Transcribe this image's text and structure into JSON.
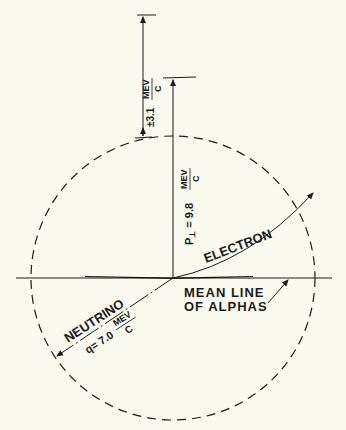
{
  "diagram": {
    "background": "#fbfaee",
    "ink": "#1a1a1a",
    "labels": {
      "electron": "ELECTRON",
      "neutrino": "NEUTRINO",
      "mean_line_1": "MEAN LINE",
      "mean_line_2": "OF ALPHAS",
      "p_perp_prefix": "P",
      "p_perp_sub": "⊥",
      "p_perp_value": "= 9.8",
      "p_perp_unit_num": "MEV",
      "p_perp_unit_den": "C",
      "uncertainty_value": "±3.1",
      "uncertainty_unit_num": "MEV",
      "uncertainty_unit_den": "C",
      "q_value": "q= 7.0",
      "q_unit_num": "MEV",
      "q_unit_den": "C"
    },
    "values": {
      "p_perp": 9.8,
      "uncertainty": 3.1,
      "q": 7.0,
      "unit": "MEV/C"
    }
  }
}
